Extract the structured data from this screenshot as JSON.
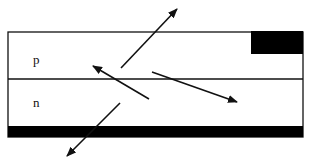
{
  "diagram": {
    "type": "pn-junction-cross-section",
    "regions": [
      {
        "id": "p",
        "label": "p"
      },
      {
        "id": "n",
        "label": "n"
      }
    ],
    "colors": {
      "line": "#111111",
      "contact": "#000000",
      "background": "#ffffff"
    },
    "geometry": {
      "device": {
        "x": 8,
        "y": 32,
        "width": 295,
        "height": 105
      },
      "junction_y": 79,
      "top_contact": {
        "x": 251,
        "y": 31,
        "width": 52,
        "height": 23
      },
      "bottom_contact": {
        "x": 8,
        "y": 126,
        "width": 295,
        "height": 11
      }
    },
    "arrows": [
      {
        "name": "emission-up-right",
        "x1": 121,
        "y1": 68,
        "x2": 177,
        "y2": 9
      },
      {
        "name": "emission-up-left",
        "x1": 149,
        "y1": 99,
        "x2": 93,
        "y2": 66
      },
      {
        "name": "emission-down-right",
        "x1": 152,
        "y1": 72,
        "x2": 237,
        "y2": 102
      },
      {
        "name": "emission-down-left",
        "x1": 120,
        "y1": 103,
        "x2": 67,
        "y2": 156
      }
    ]
  }
}
